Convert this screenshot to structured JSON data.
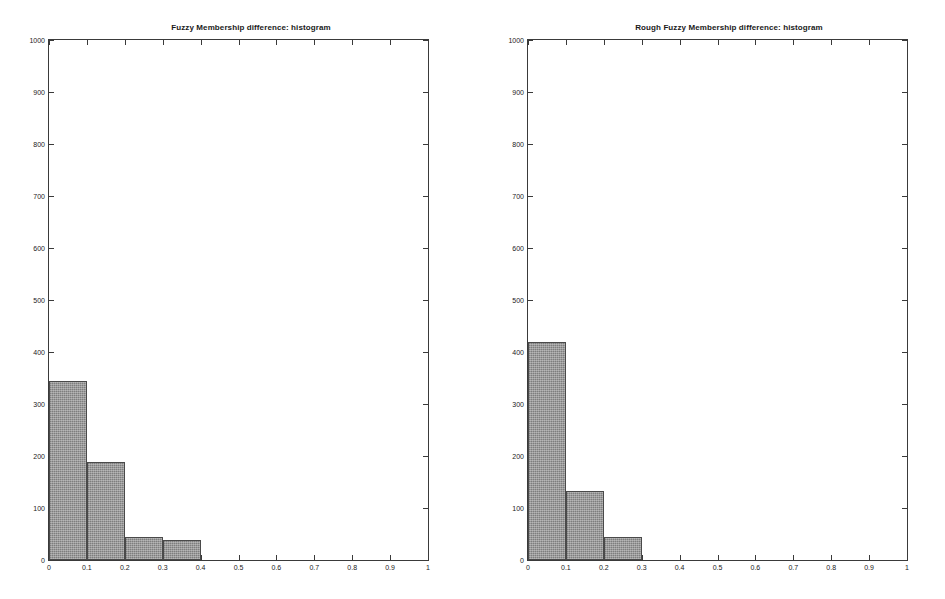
{
  "figure": {
    "background_color": "#ffffff",
    "axis_color": "#3a3a3a",
    "bar_fill_color": "#8c8c8c",
    "bar_edge_color": "#4a4a4a"
  },
  "panels": [
    {
      "id": "left",
      "title": "Fuzzy Membership difference: histogram"
    },
    {
      "id": "right",
      "title": "Rough Fuzzy Membership difference: histogram"
    }
  ],
  "axis": {
    "x_ticks": [
      "0",
      "0.1",
      "0.2",
      "0.3",
      "0.4",
      "0.5",
      "0.6",
      "0.7",
      "0.8",
      "0.9",
      "1"
    ],
    "y_ticks": [
      "0",
      "100",
      "200",
      "300",
      "400",
      "500",
      "600",
      "700",
      "800",
      "900",
      "1000"
    ]
  },
  "chart_data": [
    {
      "type": "bar",
      "title": "Fuzzy Membership difference: histogram",
      "xlabel": "",
      "ylabel": "",
      "xlim": [
        0,
        1
      ],
      "ylim": [
        0,
        1000
      ],
      "grid": false,
      "legend": null,
      "bin_edges": [
        0,
        0.1,
        0.2,
        0.3,
        0.4
      ],
      "categories": [
        "0-0.1",
        "0.1-0.2",
        "0.2-0.3",
        "0.3-0.4"
      ],
      "values": [
        344,
        188,
        44,
        38
      ],
      "x_tick_labels": [
        "0",
        "0.1",
        "0.2",
        "0.3",
        "0.4",
        "0.5",
        "0.6",
        "0.7",
        "0.8",
        "0.9",
        "1"
      ],
      "y_tick_labels": [
        "0",
        "100",
        "200",
        "300",
        "400",
        "500",
        "600",
        "700",
        "800",
        "900",
        "1000"
      ]
    },
    {
      "type": "bar",
      "title": "Rough Fuzzy Membership difference: histogram",
      "xlabel": "",
      "ylabel": "",
      "xlim": [
        0,
        1
      ],
      "ylim": [
        0,
        1000
      ],
      "grid": false,
      "legend": null,
      "bin_edges": [
        0,
        0.1,
        0.2,
        0.3
      ],
      "categories": [
        "0-0.1",
        "0.1-0.2",
        "0.2-0.3"
      ],
      "values": [
        420,
        132,
        45
      ],
      "x_tick_labels": [
        "0",
        "0.1",
        "0.2",
        "0.3",
        "0.4",
        "0.5",
        "0.6",
        "0.7",
        "0.8",
        "0.9",
        "1"
      ],
      "y_tick_labels": [
        "0",
        "100",
        "200",
        "300",
        "400",
        "500",
        "600",
        "700",
        "800",
        "900",
        "1000"
      ]
    }
  ]
}
